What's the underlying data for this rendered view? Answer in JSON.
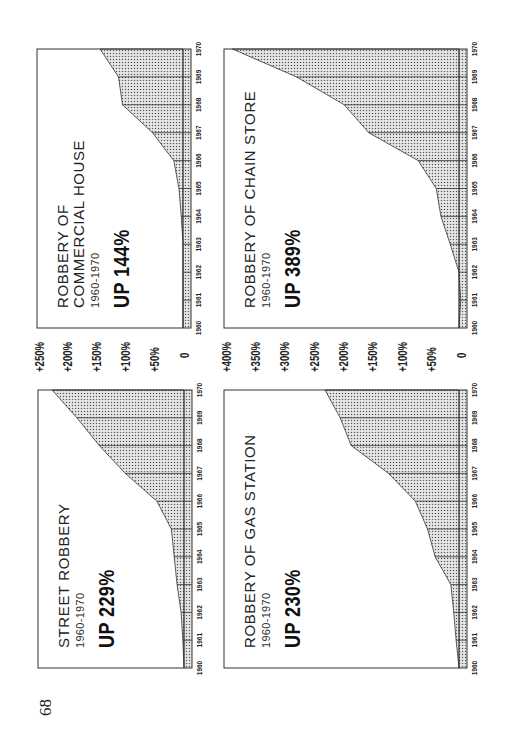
{
  "page": {
    "number": "68"
  },
  "colors": {
    "ink": "#222222",
    "fill": "#c8c8c8",
    "paper": "#ffffff"
  },
  "axes": {
    "left_scale": [
      "+250%",
      "+200%",
      "+150%",
      "+100%",
      "+50%",
      "0"
    ],
    "right_scale": [
      "+400%",
      "+350%",
      "+300%",
      "+250%",
      "+200%",
      "+150%",
      "+100%",
      "+50%",
      "0"
    ]
  },
  "charts": {
    "street": {
      "title": "STREET ROBBERY",
      "range": "1960-1970",
      "change": "UP 229%"
    },
    "gas": {
      "title": "ROBBERY OF GAS STATION",
      "range": "1960-1970",
      "change": "UP 230%"
    },
    "commercial": {
      "title": "ROBBERY OF\nCOMMERCIAL HOUSE",
      "range": "1960-1970",
      "change": "UP 144%"
    },
    "chain": {
      "title": "ROBBERY OF CHAIN STORE",
      "range": "1960-1970",
      "change": "UP 389%"
    }
  },
  "chart_data": [
    {
      "type": "area",
      "title": "STREET ROBBERY 1960-1970 — UP 229%",
      "xlabel": "Year",
      "ylabel": "Percent change since 1960",
      "x": [
        1960,
        1961,
        1962,
        1963,
        1964,
        1965,
        1966,
        1967,
        1968,
        1969,
        1970
      ],
      "values": [
        0,
        2,
        5,
        12,
        17,
        22,
        47,
        102,
        147,
        186,
        229
      ],
      "ylim": [
        0,
        250
      ],
      "yticks": [
        "0",
        "+50%",
        "+100%",
        "+150%",
        "+200%",
        "+250%"
      ],
      "grid": "vertical lines at each year"
    },
    {
      "type": "area",
      "title": "ROBBERY OF GAS STATION 1960-1970 — UP 230%",
      "xlabel": "Year",
      "ylabel": "Percent change since 1960",
      "x": [
        1960,
        1961,
        1962,
        1963,
        1964,
        1965,
        1966,
        1967,
        1968,
        1969,
        1970
      ],
      "values": [
        0,
        5,
        9,
        14,
        41,
        54,
        75,
        121,
        185,
        204,
        230
      ],
      "ylim": [
        0,
        400
      ],
      "yticks": [
        "0",
        "+50%",
        "+100%",
        "+150%",
        "+200%",
        "+250%",
        "+300%",
        "+350%",
        "+400%"
      ],
      "grid": "vertical lines at each year"
    },
    {
      "type": "area",
      "title": "ROBBERY OF COMMERCIAL HOUSE 1960-1970 — UP 144%",
      "xlabel": "Year",
      "ylabel": "Percent change since 1960",
      "x": [
        1960,
        1961,
        1962,
        1963,
        1964,
        1965,
        1966,
        1967,
        1968,
        1969,
        1970
      ],
      "values": [
        0,
        0,
        0,
        0,
        3,
        7,
        16,
        53,
        105,
        112,
        144
      ],
      "ylim": [
        0,
        250
      ],
      "yticks": [
        "0",
        "+50%",
        "+100%",
        "+150%",
        "+200%",
        "+250%"
      ],
      "grid": "vertical lines at each year"
    },
    {
      "type": "area",
      "title": "ROBBERY OF CHAIN STORE 1960-1970 — UP 389%",
      "xlabel": "Year",
      "ylabel": "Percent change since 1960",
      "x": [
        1960,
        1961,
        1962,
        1963,
        1964,
        1965,
        1966,
        1967,
        1968,
        1969,
        1970
      ],
      "values": [
        0,
        -3,
        0,
        15,
        31,
        39,
        70,
        155,
        197,
        279,
        389
      ],
      "ylim": [
        0,
        400
      ],
      "yticks": [
        "0",
        "+50%",
        "+100%",
        "+150%",
        "+200%",
        "+250%",
        "+300%",
        "+350%",
        "+400%"
      ],
      "grid": "vertical lines at each year"
    }
  ]
}
